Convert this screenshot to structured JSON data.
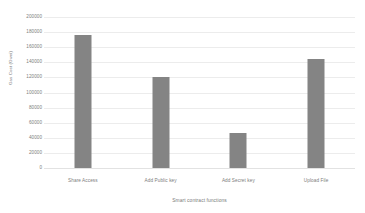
{
  "chart_data": {
    "type": "bar",
    "title": "",
    "categories": [
      "Share Access",
      "Add Public key",
      "Add Secret key",
      "Upload File"
    ],
    "values": [
      176000,
      120000,
      47000,
      144000
    ],
    "xlabel": "Smart contract functions",
    "ylabel": "Gas Cost (Gwei)",
    "ylim": [
      0,
      200000
    ],
    "ytick_step": 20000,
    "yticks": [
      200000,
      180000,
      160000,
      140000,
      120000,
      100000,
      80000,
      60000,
      40000,
      20000,
      0
    ],
    "ytick_labels": [
      "200000",
      "180000",
      "160000",
      "140000",
      "120000",
      "100000",
      "80000",
      "60000",
      "40000",
      "20000",
      "0"
    ],
    "grid": true,
    "grid_axis": "y",
    "legend": false,
    "legend_position": "none",
    "series": [
      {
        "name": "Gas Cost (Gwei)",
        "values": [
          176000,
          120000,
          47000,
          144000
        ]
      }
    ],
    "colors": {
      "bar": "#848484",
      "gridline": "#ececec",
      "baseline": "#e2e2e2",
      "tick_label": "#7d7d7d",
      "axis_title": "#7a7a7a",
      "background": "#ffffff"
    }
  }
}
